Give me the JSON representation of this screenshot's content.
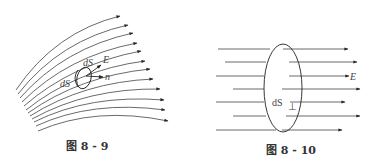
{
  "figures": [
    {
      "id": "fig-8-9",
      "caption": "图 8 - 9",
      "labels": {
        "dS_left": "dS",
        "dS_top": "dS",
        "E": "E",
        "n": "n"
      },
      "field_line_count": 12,
      "description": "Curved electric field lines with a small surface element dS and normal vector n"
    },
    {
      "id": "fig-8-10",
      "caption": "图 8 - 10",
      "labels": {
        "dS_perp": "dS",
        "perp_sub": "⊥",
        "E": "E"
      },
      "field_line_count": 7,
      "description": "Uniform parallel field lines passing through a perpendicular surface element dS⊥"
    }
  ],
  "colors": {
    "line": "#333333",
    "ink": "#222222"
  }
}
